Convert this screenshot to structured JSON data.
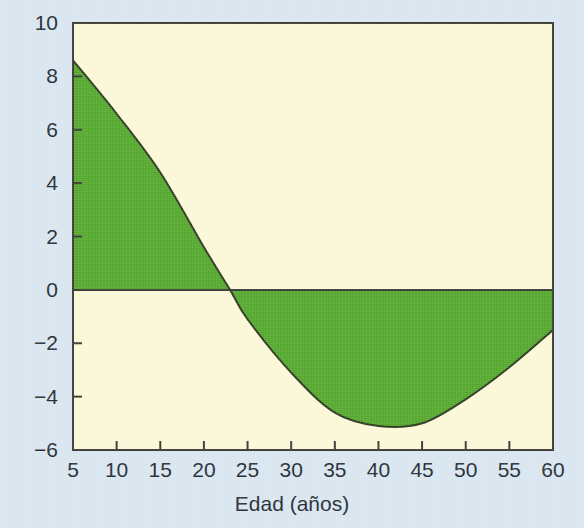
{
  "figure": {
    "background_color": "#d9e6f0",
    "plot_background_color": "#fbf8d8",
    "border_color": "#3a3a32",
    "fill_color": "#55a82e",
    "line_color": "#2e3a22",
    "tick_label_color": "#262c33"
  },
  "chart_data": {
    "type": "area",
    "title": "",
    "subtitle": "",
    "xlabel": "Edad (años)",
    "ylabel": "",
    "xlim": [
      5,
      60
    ],
    "ylim": [
      -6,
      10
    ],
    "xticks": [
      5,
      10,
      15,
      20,
      25,
      30,
      35,
      40,
      45,
      50,
      55,
      60
    ],
    "yticks": [
      10,
      8,
      6,
      4,
      2,
      0,
      -2,
      -4,
      -6
    ],
    "xtick_labels": [
      "5",
      "10",
      "15",
      "20",
      "25",
      "30",
      "35",
      "40",
      "45",
      "50",
      "55",
      "60"
    ],
    "ytick_labels": [
      "10",
      "8",
      "6",
      "4",
      "2",
      "0",
      "−2",
      "−4",
      "−6"
    ],
    "grid": false,
    "legend": null,
    "baseline": 0,
    "zero_crossing": 23,
    "annotations": [],
    "series": [
      {
        "name": "",
        "fill": "#55a82e",
        "x": [
          5,
          10,
          15,
          20,
          23,
          25,
          30,
          35,
          40,
          45,
          50,
          55,
          60
        ],
        "values": [
          8.6,
          6.6,
          4.4,
          1.6,
          0.0,
          -1.1,
          -3.1,
          -4.6,
          -5.1,
          -5.0,
          -4.1,
          -2.9,
          -1.5
        ]
      }
    ]
  }
}
